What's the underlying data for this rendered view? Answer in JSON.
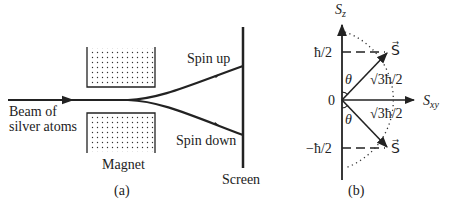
{
  "panel_a": {
    "caption": "(a)",
    "beam_label_line1": "Beam of",
    "beam_label_line2": "silver atoms",
    "magnet_label": "Magnet",
    "spin_up_label": "Spin up",
    "spin_down_label": "Spin down",
    "screen_label": "Screen"
  },
  "panel_b": {
    "caption": "(b)",
    "vertical_axis_label": "S",
    "vertical_axis_sub": "z",
    "horizontal_axis_label": "S",
    "horizontal_axis_sub": "xy",
    "tick_top": "ħ/2",
    "tick_zero": "0",
    "tick_bottom": "−ħ/2",
    "vector_label": "S⃗",
    "magnitude_label": "√3ħ/2",
    "angle_label": "θ"
  },
  "colors": {
    "ink": "#222222",
    "background": "#ffffff"
  }
}
